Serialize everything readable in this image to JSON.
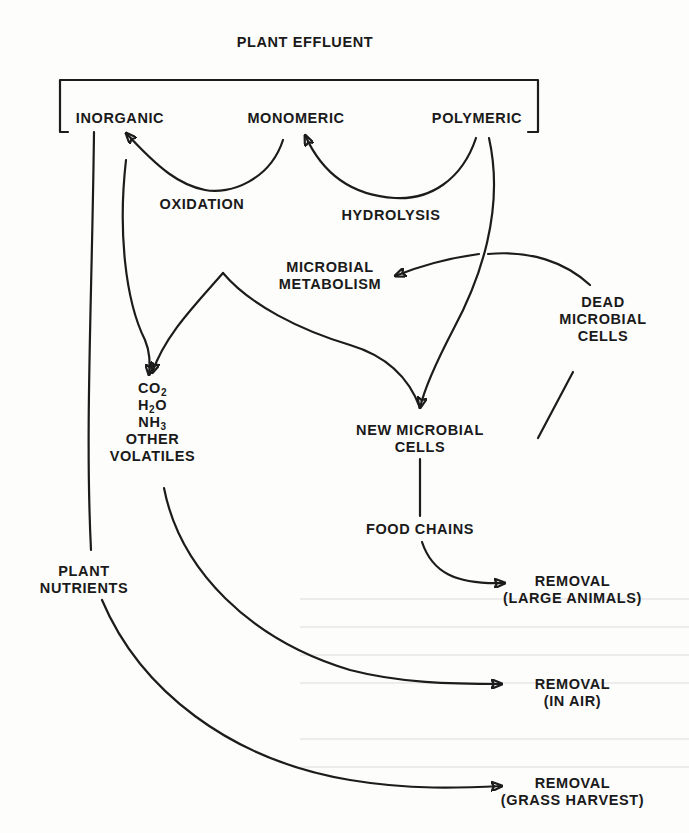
{
  "diagram": {
    "title": "PLANT EFFLUENT",
    "effluent_fractions": [
      "INORGANIC",
      "MONOMERIC",
      "POLYMERIC"
    ],
    "processes": {
      "oxidation": "OXIDATION",
      "hydrolysis": "HYDROLYSIS",
      "metabolism": [
        "MICROBIAL",
        "METABOLISM"
      ],
      "food_chains": "FOOD CHAINS"
    },
    "products": {
      "volatiles": [
        {
          "base": "CO",
          "sub": "2",
          "tail": ""
        },
        {
          "base": "H",
          "sub": "2",
          "tail": "O"
        },
        {
          "base": "NH",
          "sub": "3",
          "tail": ""
        },
        {
          "base": "OTHER",
          "sub": "",
          "tail": ""
        },
        {
          "base": "VOLATILES",
          "sub": "",
          "tail": ""
        }
      ],
      "new_cells": [
        "NEW MICROBIAL",
        "CELLS"
      ],
      "dead_cells": [
        "DEAD",
        "MICROBIAL",
        "CELLS"
      ],
      "plant_nutrients": [
        "PLANT",
        "NUTRIENTS"
      ]
    },
    "removals": [
      {
        "line1": "REMOVAL",
        "line2": "(LARGE ANIMALS)"
      },
      {
        "line1": "REMOVAL",
        "line2": "(IN AIR)"
      },
      {
        "line1": "REMOVAL",
        "line2": "(GRASS HARVEST)"
      }
    ],
    "edges": [
      {
        "from": "MONOMERIC",
        "to": "INORGANIC",
        "label": "OXIDATION"
      },
      {
        "from": "POLYMERIC",
        "to": "MONOMERIC",
        "label": "HYDROLYSIS"
      },
      {
        "from": "POLYMERIC",
        "to": "NEW MICROBIAL CELLS"
      },
      {
        "from": "INORGANIC",
        "to": "VOLATILES"
      },
      {
        "from": "MICROBIAL METABOLISM",
        "to": "VOLATILES"
      },
      {
        "from": "MICROBIAL METABOLISM",
        "to": "NEW MICROBIAL CELLS"
      },
      {
        "from": "DEAD MICROBIAL CELLS",
        "to": "MICROBIAL METABOLISM"
      },
      {
        "from": "NEW MICROBIAL CELLS",
        "to": "DEAD MICROBIAL CELLS"
      },
      {
        "from": "NEW MICROBIAL CELLS",
        "to": "FOOD CHAINS"
      },
      {
        "from": "FOOD CHAINS",
        "to": "REMOVAL (LARGE ANIMALS)"
      },
      {
        "from": "VOLATILES",
        "to": "REMOVAL (IN AIR)"
      },
      {
        "from": "INORGANIC",
        "to": "PLANT NUTRIENTS"
      },
      {
        "from": "PLANT NUTRIENTS",
        "to": "REMOVAL (GRASS HARVEST)"
      }
    ]
  }
}
